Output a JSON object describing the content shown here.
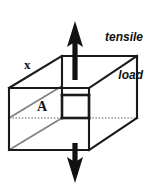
{
  "figure": {
    "background_color": "#ffffff",
    "line_color": "#1a1a1a",
    "hidden_line_color": "#9a9a9a",
    "labels": {
      "load_line1": "tensile",
      "load_line2": "load",
      "length_label": "x",
      "area_label": "A"
    }
  },
  "diagram_data": {
    "type": "engineering-sketch",
    "shape": "rectangular prism (cuboid)",
    "view": "oblique / cavalier projection",
    "annotations": [
      {
        "name": "tensile-load-text",
        "text": "tensile load",
        "style": "italic bold",
        "position": "top-right"
      },
      {
        "name": "x-dimension-label",
        "text": "x",
        "position": "upper-left, along top-left receding edge"
      },
      {
        "name": "area-label",
        "text": "A",
        "position": "center-left, on interior cross-section plane"
      }
    ],
    "arrows": [
      {
        "name": "top-load-arrow",
        "direction": "up",
        "x": 75,
        "tip_y": 22,
        "tail_y": 58
      },
      {
        "name": "bottom-load-arrow",
        "direction": "down",
        "x": 75,
        "tip_y": 182,
        "tail_y": 148
      }
    ],
    "cross_section": {
      "name": "area-A-section",
      "shape": "square",
      "emphasis": "thick outline",
      "bounds": {
        "left": 62,
        "right": 89,
        "top": 95,
        "bottom": 118
      }
    },
    "vertices": {
      "front_top_left": [
        9,
        88
      ],
      "front_top_right": [
        89,
        88
      ],
      "front_bottom_left": [
        9,
        150
      ],
      "front_bottom_right": [
        89,
        150
      ],
      "back_top_left": [
        62,
        56
      ],
      "back_top_right": [
        137,
        56
      ],
      "back_bottom_left": [
        62,
        118
      ],
      "back_bottom_right": [
        137,
        118
      ]
    },
    "hidden_edges": [
      "back_bottom_left to front_bottom_left (dotted)",
      "back_bottom_left to back_bottom_right (dotted)"
    ]
  }
}
